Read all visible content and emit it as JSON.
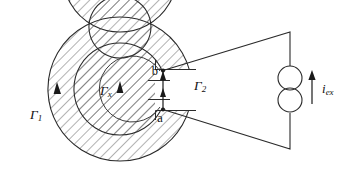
{
  "figure": {
    "background_color": "#ffffff",
    "ink_color": "#2b2b2b",
    "width": 355,
    "height": 179
  },
  "labels": {
    "gamma1": {
      "base": "Γ",
      "sub": "1",
      "text": "Γ1",
      "x": 30,
      "y": 116
    },
    "gammax": {
      "base": "Γ",
      "sub": "x",
      "text": "Γx",
      "x": 100,
      "y": 92
    },
    "gamma2": {
      "base": "Γ",
      "sub": "2",
      "text": "Γ2",
      "x": 194,
      "y": 87
    },
    "point_b": {
      "text": "b",
      "x": 158,
      "y": 72
    },
    "point_a": {
      "text": "a",
      "x": 160,
      "y": 117
    },
    "current": {
      "base": "i",
      "sub": "ex",
      "text": "iex",
      "x": 322,
      "y": 90
    }
  },
  "core": {
    "center_x": 120,
    "center_y": 89,
    "outer_band": {
      "r_outer": 72,
      "r_inner": 57
    },
    "inner_band": {
      "r_outer": 46,
      "r_inner": 31
    },
    "hatch_angle_deg": 45,
    "gap_label": "air gap between terminals a and b"
  },
  "flux_paths": [
    {
      "name": "Γ1",
      "direction": "counterclockwise",
      "arrow_at": "left"
    },
    {
      "name": "Γx",
      "direction": "counterclockwise",
      "arrow_at": "left"
    },
    {
      "name": "Γ2",
      "direction": "upward-in-gap",
      "arrow_at": "gap"
    }
  ],
  "circuit": {
    "source_type": "current-source",
    "source_symbol": "two-overlapping-circles",
    "source_x": 290,
    "source_y": 89,
    "arrow_direction": "up",
    "top_terminal_x": 290,
    "top_terminal_y": 32,
    "bottom_terminal_x": 290,
    "bottom_terminal_y": 149
  }
}
